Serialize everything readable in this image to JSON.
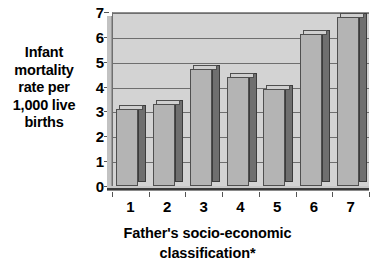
{
  "chart_data": {
    "type": "bar",
    "title": "",
    "subtitle": "",
    "categories": [
      "1",
      "2",
      "3",
      "4",
      "5",
      "6",
      "7"
    ],
    "values": [
      3.1,
      3.3,
      4.7,
      4.4,
      3.9,
      6.1,
      6.8
    ],
    "xlabel": "Father's socio-economic\nclassification*",
    "ylabel": "Infant\nmortality\nrate per\n1,000 live\nbirths",
    "ylim": [
      0,
      7
    ],
    "ytick_labels": [
      "0",
      "1",
      "2",
      "3",
      "4",
      "5",
      "6",
      "7"
    ],
    "ytick_values": [
      0,
      1,
      2,
      3,
      4,
      5,
      6,
      7
    ],
    "grid": true,
    "grid_axis": "y",
    "legend": false,
    "legend_position": "none",
    "style": "3d-column",
    "annotations": [
      "*"
    ]
  },
  "colors": {
    "page_background": "#ffffff",
    "plot_background": "#d3d3d3",
    "gridline": "#6e6e6e",
    "bar_front": "#b4b4b4",
    "bar_side": "#6f6f6f",
    "bar_top": "#cfcfcf",
    "bar_outline": "#4f4f4f",
    "axis": "#3a3a3a",
    "text": "#000000"
  }
}
